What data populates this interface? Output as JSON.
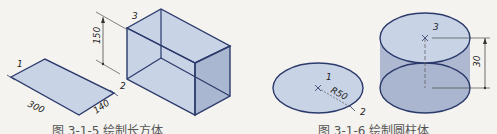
{
  "figures": [
    {
      "id": "fig-3-1-5",
      "caption": "图 3-1-5  绘制长方体",
      "labels": {
        "p1": "1",
        "p2": "2",
        "p3": "3"
      },
      "dimensions": {
        "length": "300",
        "width": "140",
        "height": "150"
      }
    },
    {
      "id": "fig-3-1-6",
      "caption": "图 3-1-6  绘制圆柱体",
      "labels": {
        "p1": "1",
        "p2": "2",
        "p3": "3"
      },
      "dimensions": {
        "radius": "R50",
        "height": "30"
      }
    }
  ],
  "colors": {
    "stroke": "#2b3a6b",
    "fill_light": "#c9d3e6",
    "fill_dark": "#a8b5cf",
    "background": "#f4f3ef"
  }
}
